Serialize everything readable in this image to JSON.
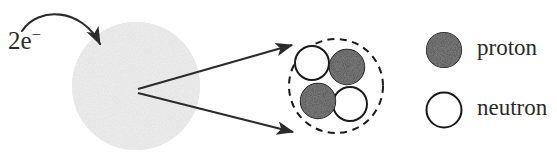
{
  "figure": {
    "type": "atomic-structure-diagram",
    "electron_label": "2e",
    "electron_charge_superscript": "−",
    "electron_label_full": "2e−",
    "atom_cloud_name": "electron-cloud",
    "nucleus_name": "nucleus-detail",
    "colors": {
      "proton_fill": "#3a3a3a",
      "neutron_fill": "#ffffff",
      "nucleon_stroke": "#1a1a1a",
      "cloud_fill": "#d8d8d8",
      "dashed_stroke": "#1a1a1a",
      "arrow_stroke": "#2b2b2b",
      "text": "#2b2b2b",
      "background": "#ffffff"
    },
    "atom": {
      "center_x": 136,
      "center_y": 86,
      "radius": 64
    },
    "nucleus": {
      "center_x": 336,
      "center_y": 85,
      "radius": 47,
      "boundary_style": "dashed",
      "nucleons": [
        {
          "kind": "neutron",
          "position": "top-left",
          "cx": 312,
          "cy": 63,
          "r": 17
        },
        {
          "kind": "proton",
          "position": "top-right",
          "cx": 347,
          "cy": 67,
          "r": 17
        },
        {
          "kind": "proton",
          "position": "bottom-left",
          "cx": 318,
          "cy": 101,
          "r": 17
        },
        {
          "kind": "neutron",
          "position": "bottom-right",
          "cx": 350,
          "cy": 104,
          "r": 17
        }
      ]
    },
    "callout_arrows": [
      {
        "name": "upper-callout-arrow",
        "from_x": 138,
        "from_y": 89,
        "to_x": 297,
        "to_y": 44
      },
      {
        "name": "lower-callout-arrow",
        "from_x": 138,
        "from_y": 93,
        "to_x": 298,
        "to_y": 133
      }
    ],
    "electron_arrow": {
      "name": "electron-curved-arrow",
      "from_x": 22,
      "from_y": 30,
      "to_x": 102,
      "to_y": 50
    }
  },
  "legend": {
    "items": [
      {
        "label": "proton",
        "marker": "filled-circle",
        "cx": 444,
        "cy": 50,
        "r": 17
      },
      {
        "label": "neutron",
        "marker": "open-circle",
        "cx": 444,
        "cy": 110,
        "r": 17
      }
    ]
  }
}
